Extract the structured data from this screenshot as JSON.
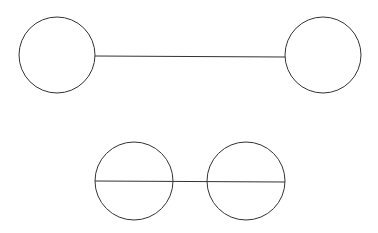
{
  "diagram": {
    "stroke": "#333333",
    "background": "#ffffff",
    "groups": [
      {
        "name": "top-pair",
        "circles": [
          {
            "cx": 57,
            "cy": 55,
            "r": 38
          },
          {
            "cx": 323,
            "cy": 55,
            "r": 38
          }
        ],
        "line": {
          "x1": 95,
          "y1": 56,
          "x2": 285,
          "y2": 57
        }
      },
      {
        "name": "bottom-pair",
        "circles": [
          {
            "cx": 134,
            "cy": 181,
            "r": 39
          },
          {
            "cx": 246,
            "cy": 181,
            "r": 39
          }
        ],
        "line": {
          "x1": 95,
          "y1": 181,
          "x2": 285,
          "y2": 182
        }
      }
    ]
  }
}
